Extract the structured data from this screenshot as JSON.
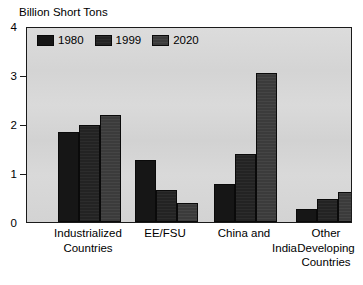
{
  "axis_title": "Billion Short Tons",
  "clipped_title_ghost": "",
  "legend": {
    "position": "top-left-inside",
    "items": [
      {
        "label": "1980",
        "color": "#161616"
      },
      {
        "label": "1999",
        "color": "#232323"
      },
      {
        "label": "2020",
        "color": "#3b3b3b"
      }
    ]
  },
  "yaxis": {
    "ticks": [
      "0",
      "1",
      "2",
      "3",
      "4"
    ],
    "min": 0,
    "max": 4
  },
  "xlabels": [
    {
      "lines": [
        "Industrialized",
        "Countries"
      ],
      "align": "center"
    },
    {
      "lines": [
        "EE/FSU"
      ],
      "align": "center"
    },
    {
      "lines": [
        "China and",
        "India"
      ],
      "align": "split-right"
    },
    {
      "lines": [
        "Other",
        "Developing",
        "Countries"
      ],
      "align": "center"
    }
  ],
  "chart_data": {
    "type": "bar",
    "title": "Billion Short Tons",
    "xlabel": "",
    "ylabel": "Billion Short Tons",
    "ylim": [
      0,
      4
    ],
    "yticks": [
      0,
      1,
      2,
      3,
      4
    ],
    "grid": false,
    "legend_position": "upper left",
    "categories": [
      "Industrialized Countries",
      "EE/FSU",
      "China and India",
      "Other Developing Countries"
    ],
    "series": [
      {
        "name": "1980",
        "color": "#161616",
        "values": [
          1.83,
          1.27,
          0.77,
          0.27
        ]
      },
      {
        "name": "1999",
        "color": "#232323",
        "values": [
          1.99,
          0.66,
          1.39,
          0.47
        ]
      },
      {
        "name": "2020",
        "color": "#3b3b3b",
        "values": [
          2.18,
          0.39,
          3.04,
          0.61
        ]
      }
    ]
  }
}
